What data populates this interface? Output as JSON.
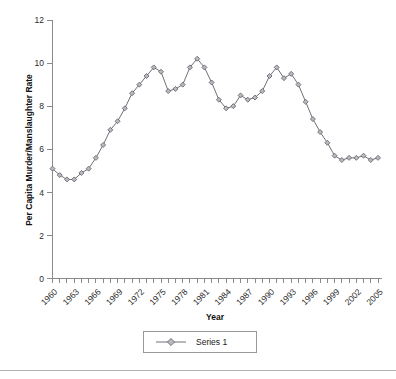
{
  "chart_data": {
    "type": "line",
    "title": "",
    "xlabel": "Year",
    "ylabel": "Per Capita Murder/Manslaughter Rate",
    "ylim": [
      0,
      12
    ],
    "yticks": [
      0,
      2,
      4,
      6,
      8,
      10,
      12
    ],
    "ytick_labels": [
      "0",
      "2",
      "4",
      "6",
      "8",
      "10",
      "12"
    ],
    "xlim": [
      1960,
      2005
    ],
    "xtick_labels": [
      "1960",
      "1963",
      "1966",
      "1969",
      "1972",
      "1975",
      "1978",
      "1981",
      "1984",
      "1987",
      "1990",
      "1993",
      "1996",
      "1999",
      "2002",
      "2005"
    ],
    "grid": false,
    "legend_position": "bottom",
    "marker": "diamond",
    "series": [
      {
        "name": "Series 1",
        "color": "#6f6f78",
        "marker_fill": "#b9b9bf",
        "x": [
          1960,
          1961,
          1962,
          1963,
          1964,
          1965,
          1966,
          1967,
          1968,
          1969,
          1970,
          1971,
          1972,
          1973,
          1974,
          1975,
          1976,
          1977,
          1978,
          1979,
          1980,
          1981,
          1982,
          1983,
          1984,
          1985,
          1986,
          1987,
          1988,
          1989,
          1990,
          1991,
          1992,
          1993,
          1994,
          1995,
          1996,
          1997,
          1998,
          1999,
          2000,
          2001,
          2002,
          2003,
          2004,
          2005
        ],
        "values": [
          5.1,
          4.8,
          4.6,
          4.6,
          4.9,
          5.1,
          5.6,
          6.2,
          6.9,
          7.3,
          7.9,
          8.6,
          9.0,
          9.4,
          9.8,
          9.6,
          8.7,
          8.8,
          9.0,
          9.8,
          10.2,
          9.8,
          9.1,
          8.3,
          7.9,
          8.0,
          8.5,
          8.3,
          8.4,
          8.7,
          9.4,
          9.8,
          9.3,
          9.5,
          9.0,
          8.2,
          7.4,
          6.8,
          6.3,
          5.7,
          5.5,
          5.6,
          5.6,
          5.7,
          5.5,
          5.6
        ]
      }
    ]
  },
  "legend": {
    "entries": [
      {
        "label": "Series 1"
      }
    ]
  },
  "axes": {
    "x_title": "Year",
    "y_title": "Per Capita Murder/Manslaughter Rate"
  }
}
